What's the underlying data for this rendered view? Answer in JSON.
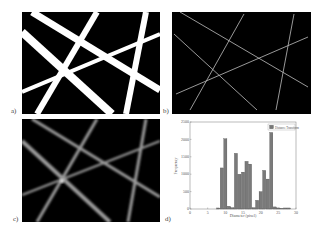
{
  "figure": {
    "panels": [
      {
        "id": "a",
        "label": "a)",
        "description": "Binary fiber network image (thick white fibers on black)"
      },
      {
        "id": "b",
        "label": "b)",
        "description": "Skeleton / centerline image of fibers"
      },
      {
        "id": "c",
        "label": "c)",
        "description": "Distance transform image (blurred gray fibers)"
      },
      {
        "id": "d",
        "label": "d)",
        "description": "Histogram of fiber diameters"
      }
    ]
  },
  "chart_data": {
    "type": "bar",
    "title": "",
    "xlabel": "Diameter (pixel)",
    "ylabel": "Frequency",
    "legend": [
      "Distance Transform"
    ],
    "legend_position": "upper right",
    "xlim": [
      0,
      30
    ],
    "ylim": [
      0,
      2500
    ],
    "x_ticks": [
      "0",
      "5",
      "10",
      "15",
      "20",
      "25",
      "30"
    ],
    "y_ticks": [
      "0",
      "500",
      "1000",
      "1500",
      "2000",
      "2500"
    ],
    "grid": false,
    "x": [
      8,
      9,
      10,
      11,
      12,
      13,
      14,
      15,
      16,
      17,
      18,
      19,
      20,
      21,
      22,
      23,
      24,
      25,
      26,
      27,
      28
    ],
    "series": [
      {
        "name": "Distance Transform",
        "values": [
          30,
          1180,
          2020,
          80,
          40,
          1600,
          1000,
          1060,
          1370,
          1290,
          40,
          250,
          500,
          1110,
          860,
          2200,
          60,
          30,
          20,
          30,
          30
        ]
      }
    ]
  }
}
